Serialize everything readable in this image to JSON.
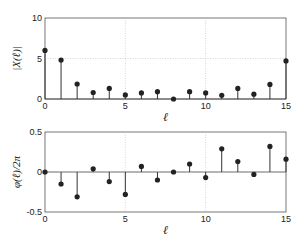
{
  "chart_data": [
    {
      "type": "stem",
      "title": "",
      "xlabel": "ℓ",
      "ylabel": "|X(ℓ)|",
      "xlim": [
        0,
        15
      ],
      "ylim": [
        0,
        10
      ],
      "xticks": [
        0,
        5,
        10,
        15
      ],
      "yticks": [
        0,
        5,
        10
      ],
      "grid": true,
      "x": [
        0,
        1,
        2,
        3,
        4,
        5,
        6,
        7,
        8,
        9,
        10,
        11,
        12,
        13,
        14,
        15
      ],
      "values": [
        6.0,
        4.8,
        1.85,
        0.8,
        1.3,
        0.5,
        0.75,
        0.9,
        0.0,
        0.9,
        0.75,
        0.45,
        1.3,
        0.6,
        1.8,
        4.7
      ]
    },
    {
      "type": "stem",
      "title": "",
      "xlabel": "ℓ",
      "ylabel": "φ(ℓ)/2π",
      "xlim": [
        0,
        15
      ],
      "ylim": [
        -0.5,
        0.5
      ],
      "xticks": [
        0,
        5,
        10,
        15
      ],
      "yticks": [
        -0.5,
        0,
        0.5
      ],
      "grid": true,
      "x": [
        0,
        1,
        2,
        3,
        4,
        5,
        6,
        7,
        8,
        9,
        10,
        11,
        12,
        13,
        14,
        15
      ],
      "values": [
        0.0,
        -0.15,
        -0.31,
        0.04,
        -0.12,
        -0.28,
        0.07,
        -0.1,
        0.0,
        0.1,
        -0.07,
        0.29,
        0.13,
        -0.03,
        0.32,
        0.16
      ]
    }
  ],
  "labels": {
    "top_ylabel": "|X(ℓ)|",
    "bottom_ylabel": "φ(ℓ)/2π",
    "xlabel": "ℓ"
  }
}
